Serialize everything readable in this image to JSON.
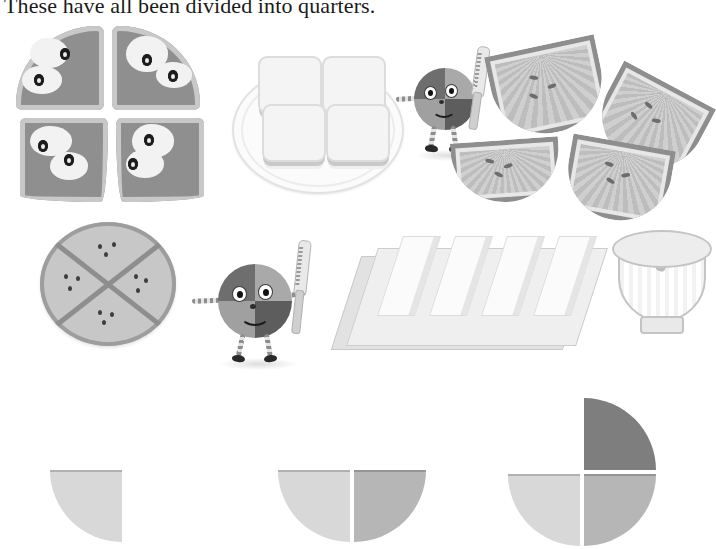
{
  "page": {
    "title": "These have all been divided into quarters.",
    "background_color": "#ffffff",
    "width": 689,
    "height": 549
  },
  "palette": {
    "light_gray": "#d8d8d8",
    "medium_gray": "#b6b6b6",
    "dark_gray": "#7e7e7e",
    "outline": "#8e8e8e",
    "text": "#1a1a1a"
  },
  "illustrations": {
    "row1": [
      {
        "name": "pizza",
        "label": "Pizza cut into quarters",
        "parts": 4
      },
      {
        "name": "sandwich-on-plate",
        "label": "Sandwich on a plate cut into quarters",
        "parts": 4
      },
      {
        "name": "mascot-with-knife",
        "label": "Quartered circle character holding a knife",
        "parts": 4
      },
      {
        "name": "melon-slices",
        "label": "Melon cut into four quarter slices",
        "parts": 4
      }
    ],
    "row2": [
      {
        "name": "round-cake",
        "label": "Round cake cut into quarters",
        "parts": 4
      },
      {
        "name": "mascot-with-knife",
        "label": "Quartered circle character holding a knife",
        "parts": 4
      },
      {
        "name": "butter-block",
        "label": "Butter block cut into four sticks on its wrapper",
        "parts": 4
      },
      {
        "name": "bowl",
        "label": "Bowl with spoon",
        "parts": 1
      }
    ]
  },
  "quarter_sets": [
    {
      "name": "one-quarter",
      "count": 1,
      "quarters": [
        {
          "position": "bottom-left",
          "color": "#d8d8d8",
          "present": true
        },
        {
          "position": "top-left",
          "color": "#d8d8d8",
          "present": false
        },
        {
          "position": "top-right",
          "color": "#7e7e7e",
          "present": false
        },
        {
          "position": "bottom-right",
          "color": "#b6b6b6",
          "present": false
        }
      ]
    },
    {
      "name": "two-quarters",
      "count": 2,
      "quarters": [
        {
          "position": "bottom-left",
          "color": "#d8d8d8",
          "present": true
        },
        {
          "position": "bottom-right",
          "color": "#b6b6b6",
          "present": true
        },
        {
          "position": "top-left",
          "color": "#d8d8d8",
          "present": false
        },
        {
          "position": "top-right",
          "color": "#7e7e7e",
          "present": false
        }
      ]
    },
    {
      "name": "three-quarters",
      "count": 3,
      "quarters": [
        {
          "position": "top-right",
          "color": "#7e7e7e",
          "present": true
        },
        {
          "position": "bottom-right",
          "color": "#b6b6b6",
          "present": true
        },
        {
          "position": "bottom-left",
          "color": "#d8d8d8",
          "present": true
        },
        {
          "position": "top-left",
          "color": "#d8d8d8",
          "present": false
        }
      ]
    }
  ]
}
